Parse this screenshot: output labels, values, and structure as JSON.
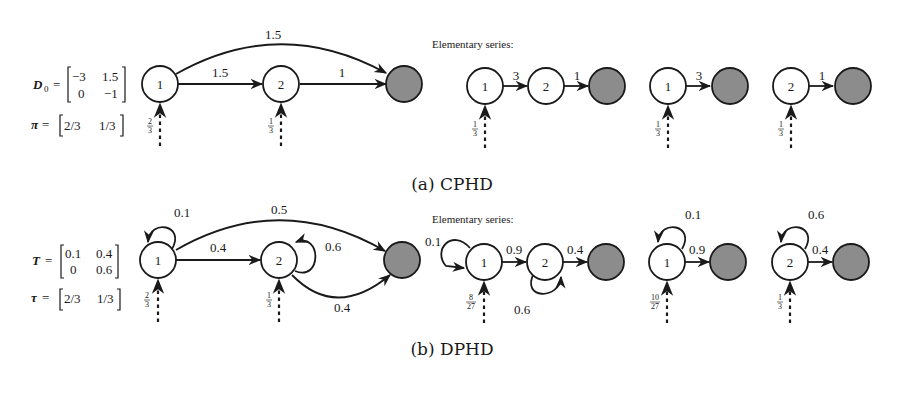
{
  "colors": {
    "absorbing_state": "#8c8c8c",
    "ink": "#1a1a1a",
    "background": "#ffffff"
  },
  "elementary_series_label": "Elementary series:",
  "panel_a": {
    "caption": "(a) CPHD",
    "matrix_name": "D",
    "matrix_sub": "0",
    "matrix": [
      [
        "−3",
        "1.5"
      ],
      [
        "0",
        "−1"
      ]
    ],
    "vector_name": "π",
    "vector": [
      "2/3",
      "1/3"
    ],
    "main_graph": {
      "nodes": [
        "1",
        "2"
      ],
      "edges": [
        {
          "from": "1",
          "to": "2",
          "label": "1.5"
        },
        {
          "from": "2",
          "to": "absorbing",
          "label": "1"
        },
        {
          "from": "1",
          "to": "absorbing",
          "label": "1.5"
        }
      ],
      "initial": [
        {
          "node": "1",
          "num": "2",
          "den": "3"
        },
        {
          "node": "2",
          "num": "1",
          "den": "3"
        }
      ]
    },
    "elementary": [
      {
        "nodes": [
          "1",
          "2"
        ],
        "edges": [
          "3",
          "1"
        ],
        "initial": {
          "num": "1",
          "den": "3"
        }
      },
      {
        "nodes": [
          "1"
        ],
        "edges": [
          "3"
        ],
        "initial": {
          "num": "1",
          "den": "3"
        }
      },
      {
        "nodes": [
          "2"
        ],
        "edges": [
          "1"
        ],
        "initial": {
          "num": "1",
          "den": "3"
        }
      }
    ]
  },
  "panel_b": {
    "caption": "(b) DPHD",
    "matrix_name": "T",
    "matrix": [
      [
        "0.1",
        "0.4"
      ],
      [
        "0",
        "0.6"
      ]
    ],
    "vector_name": "τ",
    "vector": [
      "2/3",
      "1/3"
    ],
    "main_graph": {
      "nodes": [
        "1",
        "2"
      ],
      "edges": [
        {
          "from": "1",
          "to": "1",
          "label": "0.1"
        },
        {
          "from": "1",
          "to": "2",
          "label": "0.4"
        },
        {
          "from": "2",
          "to": "2",
          "label": "0.6"
        },
        {
          "from": "1",
          "to": "absorbing",
          "label": "0.5"
        },
        {
          "from": "2",
          "to": "absorbing",
          "label": "0.4"
        }
      ],
      "initial": [
        {
          "node": "1",
          "num": "2",
          "den": "3"
        },
        {
          "node": "2",
          "num": "1",
          "den": "3"
        }
      ]
    },
    "elementary": [
      {
        "nodes": [
          "1",
          "2"
        ],
        "self_loops": [
          "0.1",
          "0.6"
        ],
        "edges": [
          "0.9",
          "0.4"
        ],
        "initial": {
          "num": "8",
          "den": "27"
        }
      },
      {
        "nodes": [
          "1"
        ],
        "self_loops": [
          "0.1"
        ],
        "edges": [
          "0.9"
        ],
        "initial": {
          "num": "10",
          "den": "27"
        }
      },
      {
        "nodes": [
          "2"
        ],
        "self_loops": [
          "0.6"
        ],
        "edges": [
          "0.4"
        ],
        "initial": {
          "num": "1",
          "den": "3"
        }
      }
    ]
  }
}
